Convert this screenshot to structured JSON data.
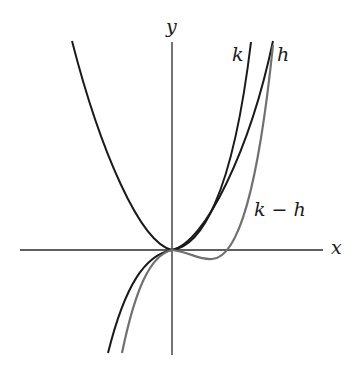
{
  "diagram": {
    "axes": {
      "x_label": "x",
      "y_label": "y",
      "origin_px": [
        172,
        250
      ],
      "x_axis_px": [
        20,
        323
      ],
      "y_axis_px": [
        42,
        355
      ],
      "color": "#1a1a1a"
    },
    "curves": [
      {
        "name": "h",
        "label": "h",
        "color": "#1a1a1a",
        "description": "parabola through origin"
      },
      {
        "name": "k",
        "label": "k",
        "color": "#1a1a1a",
        "description": "curve through origin, steeper on right, descends on left"
      },
      {
        "name": "k-minus-h",
        "label": "k − h",
        "color": "#707070",
        "description": "difference curve, dips below x-axis then rises"
      }
    ],
    "labels": {
      "k": "k",
      "h": "h",
      "k_minus_h": "k − h",
      "x": "x",
      "y": "y"
    }
  }
}
